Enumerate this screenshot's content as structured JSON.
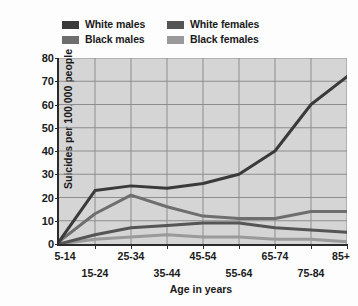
{
  "chart_data": {
    "type": "line",
    "title": "",
    "xlabel": "Age in years",
    "ylabel": "Suicides per 100,000 people",
    "categories": [
      "5-14",
      "15-24",
      "25-34",
      "35-44",
      "45-54",
      "55-64",
      "65-74",
      "75-84",
      "85+"
    ],
    "ylim": [
      0,
      80
    ],
    "yticks": [
      0,
      10,
      20,
      30,
      40,
      50,
      60,
      70,
      80
    ],
    "grid": true,
    "legend_position": "top",
    "series": [
      {
        "name": "White males",
        "color": "#3a3a3a",
        "values": [
          1,
          23,
          25,
          24,
          26,
          30,
          40,
          60,
          72
        ]
      },
      {
        "name": "White females",
        "color": "#555555",
        "values": [
          0,
          4,
          7,
          8,
          9,
          9,
          7,
          6,
          5
        ]
      },
      {
        "name": "Black males",
        "color": "#6e6e6e",
        "values": [
          1,
          13,
          21,
          16,
          12,
          11,
          11,
          14,
          14
        ]
      },
      {
        "name": "Black females",
        "color": "#9a9a9a",
        "values": [
          0,
          2,
          3,
          4,
          3,
          3,
          2,
          2,
          1
        ]
      }
    ]
  },
  "legend": {
    "items": [
      {
        "label": "White males",
        "color": "#3a3a3a"
      },
      {
        "label": "White females",
        "color": "#555555"
      },
      {
        "label": "Black males",
        "color": "#6e6e6e"
      },
      {
        "label": "Black females",
        "color": "#9a9a9a"
      }
    ]
  },
  "axes": {
    "y_title": "Suicides per 100,000 people",
    "x_title": "Age in years",
    "y_ticks": [
      "80",
      "70",
      "60",
      "50",
      "40",
      "30",
      "20",
      "10",
      "0"
    ],
    "x_ticks_top": [
      "5-14",
      "25-34",
      "45-54",
      "65-74",
      "85+"
    ],
    "x_ticks_bottom": [
      "15-24",
      "35-44",
      "55-64",
      "75-84"
    ]
  },
  "style": {
    "plot_background": "#d5d5d5",
    "grid_color": "#8d8d8d",
    "axis_color": "#2b2b2b",
    "page_background": "#fdfdfd",
    "text_color": "#1a1a1a"
  }
}
